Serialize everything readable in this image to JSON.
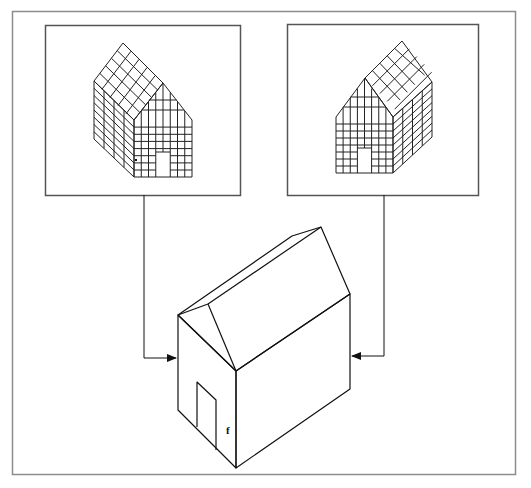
{
  "diagram": {
    "colors": {
      "background": "#ffffff",
      "outer_border": "#8c8c8c",
      "panel_border": "#555555",
      "line": "#222222"
    },
    "panels": [
      {
        "id": "left-panel",
        "label": ""
      },
      {
        "id": "right-panel",
        "label": ""
      }
    ],
    "main_house": {
      "mark_label": "f"
    },
    "connectors": [
      {
        "from": "left-panel",
        "to": "main-house-left-wall",
        "arrow": "right"
      },
      {
        "from": "right-panel",
        "to": "main-house-right-wall",
        "arrow": "left"
      }
    ]
  }
}
